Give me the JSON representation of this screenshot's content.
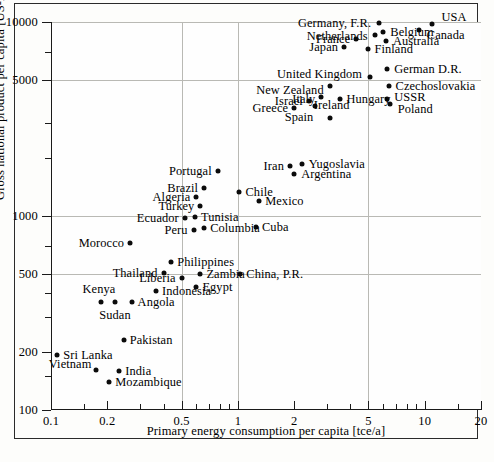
{
  "chart_data": {
    "type": "scatter",
    "title": "",
    "xlabel": "Primary energy consumption per capita [tce/a]",
    "ylabel": "Gross national product per capita [US-Dollar/a]",
    "xscale": "log",
    "yscale": "log",
    "xlim": [
      0.1,
      20
    ],
    "ylim": [
      100,
      10000
    ],
    "grid": true,
    "legend": "none",
    "xticks": [
      {
        "value": 0.1,
        "label": "0.1",
        "major": true,
        "grid": false
      },
      {
        "value": 0.2,
        "label": "0.2",
        "major": true,
        "grid": false
      },
      {
        "value": 0.5,
        "label": "0.5",
        "major": true,
        "grid": true
      },
      {
        "value": 1,
        "label": "1",
        "major": true,
        "grid": true
      },
      {
        "value": 2,
        "label": "2",
        "major": true,
        "grid": false
      },
      {
        "value": 5,
        "label": "5",
        "major": true,
        "grid": true
      },
      {
        "value": 10,
        "label": "10",
        "major": true,
        "grid": false
      },
      {
        "value": 20,
        "label": "20",
        "major": true,
        "grid": false
      }
    ],
    "xminorticks": [
      0.15,
      0.3,
      0.4,
      0.6,
      0.7,
      0.8,
      0.9,
      3,
      4,
      6,
      7,
      8,
      9,
      15
    ],
    "yticks": [
      {
        "value": 100,
        "label": "100",
        "major": true,
        "grid": false
      },
      {
        "value": 200,
        "label": "200",
        "major": true,
        "grid": false
      },
      {
        "value": 500,
        "label": "500",
        "major": true,
        "grid": true
      },
      {
        "value": 1000,
        "label": "1000",
        "major": true,
        "grid": true
      },
      {
        "value": 5000,
        "label": "5000",
        "major": true,
        "grid": true
      },
      {
        "value": 10000,
        "label": "10000",
        "major": true,
        "grid": true
      }
    ],
    "yminorticks": [
      150,
      300,
      400,
      700,
      2000,
      3000,
      7000
    ],
    "points": [
      {
        "name": "USA",
        "x": 11.0,
        "y": 9800,
        "lx": "l",
        "dx": 9,
        "dy": -7
      },
      {
        "name": "Canada",
        "x": 9.3,
        "y": 9100,
        "lx": "l",
        "dx": 8,
        "dy": 5
      },
      {
        "name": "Germany, F.R.",
        "x": 5.7,
        "y": 9900,
        "lx": "r",
        "dx": -8,
        "dy": 0
      },
      {
        "name": "Belgium",
        "x": 6.0,
        "y": 8900,
        "lx": "l",
        "dx": 7,
        "dy": 0
      },
      {
        "name": "Netherlands",
        "x": 5.4,
        "y": 8600,
        "lx": "r",
        "dx": -7,
        "dy": 1
      },
      {
        "name": "Australia",
        "x": 6.2,
        "y": 8000,
        "lx": "l",
        "dx": 7,
        "dy": 0
      },
      {
        "name": "France",
        "x": 4.3,
        "y": 8200,
        "lx": "r",
        "dx": -6,
        "dy": 0
      },
      {
        "name": "Japan",
        "x": 3.7,
        "y": 7400,
        "lx": "r",
        "dx": -6,
        "dy": 0
      },
      {
        "name": "Finland",
        "x": 5.0,
        "y": 7300,
        "lx": "l",
        "dx": 6,
        "dy": 0
      },
      {
        "name": "German D.R.",
        "x": 6.3,
        "y": 5700,
        "lx": "l",
        "dx": 7,
        "dy": 0
      },
      {
        "name": "United Kingdom",
        "x": 5.1,
        "y": 5200,
        "lx": "r",
        "dx": -8,
        "dy": -3
      },
      {
        "name": "Czechoslovakia",
        "x": 6.4,
        "y": 4700,
        "lx": "l",
        "dx": 7,
        "dy": 0
      },
      {
        "name": "New Zealand",
        "x": 3.1,
        "y": 4700,
        "lx": "r",
        "dx": -6,
        "dy": 4
      },
      {
        "name": "USSR",
        "x": 6.3,
        "y": 4000,
        "lx": "l",
        "dx": 7,
        "dy": -2
      },
      {
        "name": "Poland",
        "x": 6.5,
        "y": 3800,
        "lx": "l",
        "dx": 8,
        "dy": 5
      },
      {
        "name": "Italy",
        "x": 2.8,
        "y": 4100,
        "lx": "r",
        "dx": -6,
        "dy": 2
      },
      {
        "name": "Hungary",
        "x": 3.5,
        "y": 4000,
        "lx": "l",
        "dx": 7,
        "dy": 0
      },
      {
        "name": "Israel",
        "x": 2.4,
        "y": 3900,
        "lx": "r",
        "dx": -6,
        "dy": 0
      },
      {
        "name": "Spain",
        "x": 2.6,
        "y": 3700,
        "lx": "r",
        "dx": -2,
        "dy": 11
      },
      {
        "name": "Greece",
        "x": 2.0,
        "y": 3600,
        "lx": "r",
        "dx": -6,
        "dy": 0
      },
      {
        "name": "Ireland",
        "x": 3.1,
        "y": 3200,
        "lx": "c",
        "dx": 2,
        "dy": -13
      },
      {
        "name": "Yugoslavia",
        "x": 2.2,
        "y": 1850,
        "lx": "l",
        "dx": 7,
        "dy": 0
      },
      {
        "name": "Iran",
        "x": 1.9,
        "y": 1800,
        "lx": "r",
        "dx": -6,
        "dy": 0
      },
      {
        "name": "Argentina",
        "x": 2.0,
        "y": 1650,
        "lx": "l",
        "dx": 7,
        "dy": 0
      },
      {
        "name": "Portugal",
        "x": 0.78,
        "y": 1700,
        "lx": "r",
        "dx": -6,
        "dy": 0
      },
      {
        "name": "Brazil",
        "x": 0.66,
        "y": 1400,
        "lx": "r",
        "dx": -6,
        "dy": 0
      },
      {
        "name": "Chile",
        "x": 1.02,
        "y": 1330,
        "lx": "l",
        "dx": 6,
        "dy": 0
      },
      {
        "name": "Algeria",
        "x": 0.6,
        "y": 1250,
        "lx": "r",
        "dx": -6,
        "dy": 0
      },
      {
        "name": "Mexico",
        "x": 1.3,
        "y": 1200,
        "lx": "l",
        "dx": 6,
        "dy": 0
      },
      {
        "name": "Turkey",
        "x": 0.63,
        "y": 1130,
        "lx": "r",
        "dx": -6,
        "dy": 0
      },
      {
        "name": "Tunisia",
        "x": 0.59,
        "y": 985,
        "lx": "l",
        "dx": 6,
        "dy": 0
      },
      {
        "name": "Ecuador",
        "x": 0.52,
        "y": 975,
        "lx": "r",
        "dx": -6,
        "dy": 0
      },
      {
        "name": "Cuba",
        "x": 1.25,
        "y": 880,
        "lx": "l",
        "dx": 6,
        "dy": 0
      },
      {
        "name": "Columbia",
        "x": 0.66,
        "y": 870,
        "lx": "l",
        "dx": 6,
        "dy": 0
      },
      {
        "name": "Peru",
        "x": 0.58,
        "y": 845,
        "lx": "r",
        "dx": -6,
        "dy": 0
      },
      {
        "name": "Morocco",
        "x": 0.265,
        "y": 730,
        "lx": "r",
        "dx": -6,
        "dy": 0
      },
      {
        "name": "Philippines",
        "x": 0.44,
        "y": 580,
        "lx": "l",
        "dx": 6,
        "dy": 0
      },
      {
        "name": "Thailand",
        "x": 0.4,
        "y": 510,
        "lx": "r",
        "dx": -6,
        "dy": 0
      },
      {
        "name": "Zambia",
        "x": 0.63,
        "y": 505,
        "lx": "l",
        "dx": 6,
        "dy": 0
      },
      {
        "name": "China, P.R.",
        "x": 1.03,
        "y": 500,
        "lx": "l",
        "dx": 6,
        "dy": 0
      },
      {
        "name": "Liberia",
        "x": 0.5,
        "y": 480,
        "lx": "r",
        "dx": -6,
        "dy": 0
      },
      {
        "name": "Egypt",
        "x": 0.6,
        "y": 430,
        "lx": "l",
        "dx": 6,
        "dy": 0
      },
      {
        "name": "Indonesia",
        "x": 0.365,
        "y": 410,
        "lx": "l",
        "dx": 6,
        "dy": 0
      },
      {
        "name": "Kenya",
        "x": 0.185,
        "y": 360,
        "lx": "c",
        "dx": -2,
        "dy": -13
      },
      {
        "name": "Sudan",
        "x": 0.22,
        "y": 360,
        "lx": "c",
        "dx": 0,
        "dy": 13
      },
      {
        "name": "Angola",
        "x": 0.27,
        "y": 360,
        "lx": "l",
        "dx": 6,
        "dy": 0
      },
      {
        "name": "Pakistan",
        "x": 0.245,
        "y": 230,
        "lx": "l",
        "dx": 6,
        "dy": 0
      },
      {
        "name": "Sri Lanka",
        "x": 0.108,
        "y": 193,
        "lx": "l",
        "dx": 6,
        "dy": 0
      },
      {
        "name": "Vietnam",
        "x": 0.175,
        "y": 160,
        "lx": "r",
        "dx": -5,
        "dy": -6
      },
      {
        "name": "India",
        "x": 0.232,
        "y": 158,
        "lx": "l",
        "dx": 6,
        "dy": 0
      },
      {
        "name": "Mozambique",
        "x": 0.205,
        "y": 140,
        "lx": "l",
        "dx": 6,
        "dy": 0
      }
    ]
  }
}
